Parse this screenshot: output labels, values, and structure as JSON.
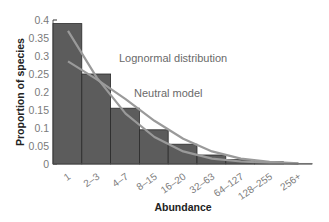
{
  "chart_data": {
    "type": "bar",
    "title": "",
    "xlabel": "Abundance",
    "ylabel": "Proportion of species",
    "ylim": [
      0,
      0.4
    ],
    "yticks": [
      "0",
      "0.05",
      "0.1",
      "0.15",
      "0.2",
      "0.25",
      "0.3",
      "0.35",
      "0.4"
    ],
    "categories": [
      "1",
      "2-3",
      "4-7",
      "8-15",
      "16-20",
      "32-63",
      "64-127",
      "128-255",
      "256+"
    ],
    "values": [
      0.39,
      0.25,
      0.155,
      0.095,
      0.055,
      0.025,
      0.012,
      0.006,
      0.002
    ],
    "series": [
      {
        "name": "Observed",
        "type": "bar",
        "values": [
          0.39,
          0.25,
          0.155,
          0.095,
          0.055,
          0.025,
          0.012,
          0.006,
          0.002
        ]
      },
      {
        "name": "Lognormal distribution",
        "type": "line",
        "values": [
          0.37,
          0.24,
          0.14,
          0.075,
          0.035,
          0.015,
          0.007,
          0.003,
          0.001
        ]
      },
      {
        "name": "Neutral model",
        "type": "line",
        "values": [
          0.285,
          0.235,
          0.18,
          0.12,
          0.07,
          0.035,
          0.015,
          0.006,
          0.002
        ]
      }
    ],
    "annotations": [
      "Lognormal distribution",
      "Neutral model"
    ],
    "grid": false,
    "legend": "inline annotations",
    "colors": {
      "bar": "#5c5c5c",
      "bar_edge": "#2a2a2a",
      "lines": "#9a9a9a"
    }
  },
  "labels": {
    "lognormal": "Lognormal distribution",
    "neutral": "Neutral model",
    "xlabel": "Abundance",
    "ylabel": "Proportion of species"
  }
}
